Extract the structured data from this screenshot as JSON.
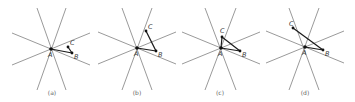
{
  "figure": {
    "panels": [
      {
        "caption": "(a)",
        "A": {
          "label": "A",
          "x": 51,
          "y": 49
        },
        "B": {
          "label": "B",
          "x": 72,
          "y": 53
        },
        "C": {
          "label": "C",
          "x": 68,
          "y": 47
        },
        "segments": [
          "AB",
          "BC"
        ],
        "rays": [
          [
            37,
            8,
            66,
            90
          ],
          [
            66,
            8,
            37,
            90
          ],
          [
            12,
            33,
            90,
            65
          ],
          [
            12,
            65,
            90,
            33
          ]
        ]
      },
      {
        "caption": "(b)",
        "A": {
          "label": "A",
          "x": 137,
          "y": 48
        },
        "B": {
          "label": "B",
          "x": 156,
          "y": 51
        },
        "C": {
          "label": "C",
          "x": 146,
          "y": 31
        },
        "segments": [
          "AB",
          "BC"
        ],
        "rays": [
          [
            122,
            8,
            152,
            90
          ],
          [
            152,
            8,
            122,
            90
          ],
          [
            98,
            32,
            176,
            64
          ],
          [
            98,
            64,
            176,
            32
          ]
        ]
      },
      {
        "caption": "(c)",
        "A": {
          "label": "A",
          "x": 221,
          "y": 48
        },
        "B": {
          "label": "B",
          "x": 240,
          "y": 51
        },
        "C": {
          "label": "C",
          "x": 222,
          "y": 37
        },
        "segments": [
          "AB",
          "BC",
          "AC"
        ],
        "rays": [
          [
            205,
            8,
            236,
            90
          ],
          [
            236,
            8,
            205,
            90
          ],
          [
            182,
            32,
            260,
            64
          ],
          [
            182,
            64,
            260,
            32
          ]
        ]
      },
      {
        "caption": "(d)",
        "A": {
          "label": "A",
          "x": 305,
          "y": 47
        },
        "B": {
          "label": "B",
          "x": 323,
          "y": 50
        },
        "C": {
          "label": "C",
          "x": 293,
          "y": 28
        },
        "segments": [
          "AB",
          "BC"
        ],
        "rays": [
          [
            289,
            8,
            319,
            90
          ],
          [
            319,
            8,
            289,
            90
          ],
          [
            266,
            31,
            344,
            63
          ],
          [
            266,
            63,
            344,
            31
          ]
        ]
      }
    ]
  }
}
